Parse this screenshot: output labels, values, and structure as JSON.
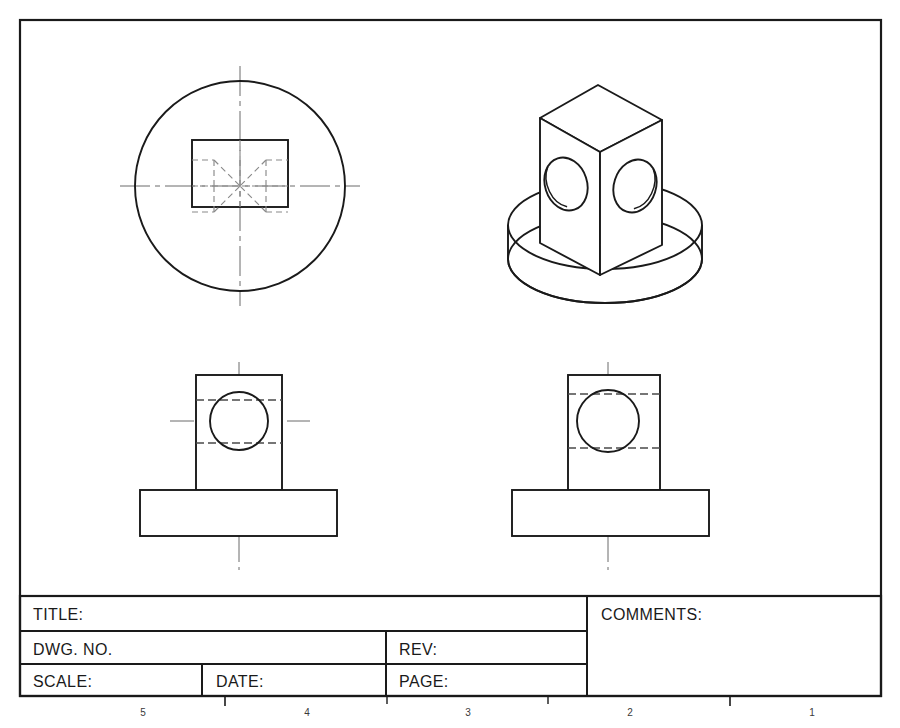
{
  "sheet": {
    "width": 900,
    "height": 728,
    "background": "#ffffff",
    "line_color": "#1a1a1a",
    "hidden_line_color": "#6b6b6b",
    "center_line_color": "#6b6b6b",
    "border": {
      "x": 20,
      "y": 20,
      "width": 861,
      "height": 676
    }
  },
  "title_block": {
    "x": 20,
    "y": 596,
    "width": 861,
    "height": 100,
    "fields": [
      {
        "key": "title",
        "label": "TITLE:",
        "value": ""
      },
      {
        "key": "dwg_no",
        "label": "DWG. NO.",
        "value": ""
      },
      {
        "key": "rev",
        "label": "REV:",
        "value": ""
      },
      {
        "key": "scale",
        "label": "SCALE:",
        "value": ""
      },
      {
        "key": "date",
        "label": "DATE:",
        "value": ""
      },
      {
        "key": "page",
        "label": "PAGE:",
        "value": ""
      },
      {
        "key": "comments",
        "label": "COMMENTS:",
        "value": ""
      }
    ]
  },
  "zone_markers": {
    "labels": [
      "5",
      "4",
      "3",
      "2",
      "1"
    ],
    "x_positions": [
      143,
      307,
      468,
      630,
      812
    ],
    "tick_x": [
      225,
      387,
      548,
      730
    ],
    "y": 712
  },
  "views": {
    "top_view": {
      "name": "top-view",
      "circle": {
        "cx": 240,
        "cy": 186,
        "r": 105
      },
      "square": {
        "x": 192,
        "y": 140,
        "w": 96,
        "h": 67
      },
      "hidden_pattern": "cross-hole-x",
      "center_lines": {
        "h_y": 186,
        "v_x": 240,
        "extent": 120
      }
    },
    "iso_view": {
      "name": "isometric-view",
      "cylinder": {
        "cx": 605,
        "cy_top": 225,
        "rx": 97,
        "ry": 44,
        "height": 34
      },
      "cube": {
        "apex": [
          598,
          85
        ],
        "left": [
          540,
          118
        ],
        "front": [
          600,
          152
        ],
        "right": [
          662,
          120
        ],
        "bottom_front": [
          600,
          275
        ],
        "bottom_left": [
          540,
          243
        ],
        "bottom_right": [
          662,
          245
        ]
      },
      "holes": [
        {
          "cx": 566,
          "cy": 184,
          "rx": 21,
          "ry": 27,
          "rot": -20
        },
        {
          "cx": 634,
          "cy": 186,
          "rx": 21,
          "ry": 27,
          "rot": 20
        }
      ]
    },
    "front_view": {
      "name": "front-view",
      "block": {
        "x": 196,
        "y": 375,
        "w": 86,
        "h": 115
      },
      "base": {
        "x": 140,
        "y": 490,
        "w": 197,
        "h": 46
      },
      "hole": {
        "cx": 239,
        "cy": 421,
        "r": 29
      },
      "hidden_lines_y": [
        400,
        443
      ],
      "center_lines": {
        "h_y": 421,
        "v_x": 239
      }
    },
    "right_view": {
      "name": "right-side-view",
      "block": {
        "x": 568,
        "y": 375,
        "w": 92,
        "h": 115
      },
      "base": {
        "x": 512,
        "y": 490,
        "w": 197,
        "h": 46
      },
      "hole": {
        "cx": 608,
        "cy": 421,
        "r": 31
      },
      "hidden_lines_y": [
        394,
        448
      ],
      "center_lines": {
        "h_y": 421,
        "v_x": 608
      }
    }
  }
}
